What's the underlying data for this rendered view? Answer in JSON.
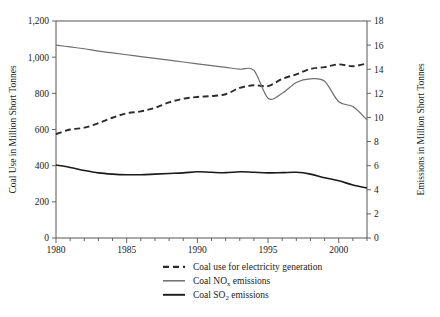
{
  "chart_data": {
    "type": "line",
    "title": "",
    "subtitle": "",
    "xlabel": "",
    "ylabel": "Coal Use in Million Short Tonnes",
    "y2label": "Emissions in Million Short Tonnes",
    "xlim": [
      1980,
      2002
    ],
    "ylim": [
      0,
      1200
    ],
    "y2lim": [
      0,
      18
    ],
    "grid": false,
    "legend_position": "bottom",
    "x": [
      1980,
      1981,
      1982,
      1983,
      1984,
      1985,
      1986,
      1987,
      1988,
      1989,
      1990,
      1991,
      1992,
      1993,
      1994,
      1995,
      1996,
      1997,
      1998,
      1999,
      2000,
      2001,
      2002
    ],
    "xticks": [
      1980,
      1981,
      1982,
      1983,
      1984,
      1985,
      1986,
      1987,
      1988,
      1989,
      1990,
      1991,
      1992,
      1993,
      1994,
      1995,
      1996,
      1997,
      1998,
      1999,
      2000,
      2001,
      2002
    ],
    "xticklabels": [
      "1980",
      "",
      "",
      "",
      "",
      "1985",
      "",
      "",
      "",
      "",
      "1990",
      "",
      "",
      "",
      "",
      "1995",
      "",
      "",
      "",
      "",
      "2000",
      "",
      ""
    ],
    "yticks": [
      0,
      200,
      400,
      600,
      800,
      1000,
      1200
    ],
    "yticklabels": [
      "0",
      "200",
      "400",
      "600",
      "800",
      "1,000",
      "1,200"
    ],
    "y2ticks": [
      0,
      2,
      4,
      6,
      8,
      10,
      12,
      14,
      16,
      18
    ],
    "y2ticklabels": [
      "0",
      "2",
      "4",
      "6",
      "8",
      "10",
      "12",
      "14",
      "16",
      "18"
    ],
    "series": [
      {
        "name": "Coal use for electricity generation",
        "legend_main": "Coal use for electricity generation",
        "legend_sub": "",
        "legend_tail": "",
        "axis": "left",
        "style": "dashed",
        "color": "#2b2b2b",
        "width": 1.9,
        "values": [
          575,
          600,
          610,
          635,
          665,
          690,
          700,
          720,
          750,
          770,
          780,
          785,
          795,
          830,
          845,
          840,
          880,
          905,
          935,
          945,
          960,
          950,
          965
        ]
      },
      {
        "name": "Coal NOx emissions",
        "legend_main": "Coal NO",
        "legend_sub": "x",
        "legend_tail": " emissions",
        "axis": "right",
        "style": "solid",
        "color": "#6e6e6e",
        "width": 1.2,
        "values": [
          16.0,
          15.85,
          15.7,
          15.5,
          15.35,
          15.2,
          15.05,
          14.9,
          14.75,
          14.6,
          14.45,
          14.3,
          14.15,
          14.0,
          13.9,
          11.6,
          12.0,
          12.9,
          13.2,
          13.0,
          11.3,
          10.9,
          9.8
        ]
      },
      {
        "name": "Coal SO2 emissions",
        "legend_main": "Coal SO",
        "legend_sub": "2",
        "legend_tail": " emissions",
        "axis": "right",
        "style": "solid",
        "color": "#1a1a1a",
        "width": 1.6,
        "values": [
          6.05,
          5.85,
          5.6,
          5.4,
          5.3,
          5.25,
          5.25,
          5.3,
          5.35,
          5.4,
          5.5,
          5.45,
          5.42,
          5.5,
          5.45,
          5.4,
          5.42,
          5.45,
          5.3,
          5.0,
          4.75,
          4.4,
          4.15
        ]
      }
    ],
    "annotations": []
  }
}
